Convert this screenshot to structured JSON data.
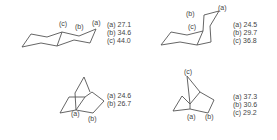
{
  "panels": [
    {
      "name": "trans-decalin",
      "labels": {
        "a": "(a)",
        "b": "(b)",
        "c": "(c)"
      },
      "shifts": [
        "(a) 27.1",
        "(b) 34.6",
        "(c) 44.0"
      ]
    },
    {
      "name": "cis-decalin",
      "labels": {
        "a": "(a)",
        "b": "(b)",
        "c": "(c)"
      },
      "shifts": [
        "(a) 24.5",
        "(b) 29.7",
        "(c) 36.8"
      ]
    },
    {
      "name": "bicyclo-octane",
      "labels": {
        "a": "(a)",
        "b": "(b)"
      },
      "shifts": [
        "(a) 24.6",
        "(b) 26.7"
      ]
    },
    {
      "name": "norbornane",
      "labels": {
        "a": "(a)",
        "b": "(b)",
        "c": "(c)"
      },
      "shifts": [
        "(a) 37.3",
        "(b) 30.6",
        "(c) 29.2"
      ]
    }
  ]
}
